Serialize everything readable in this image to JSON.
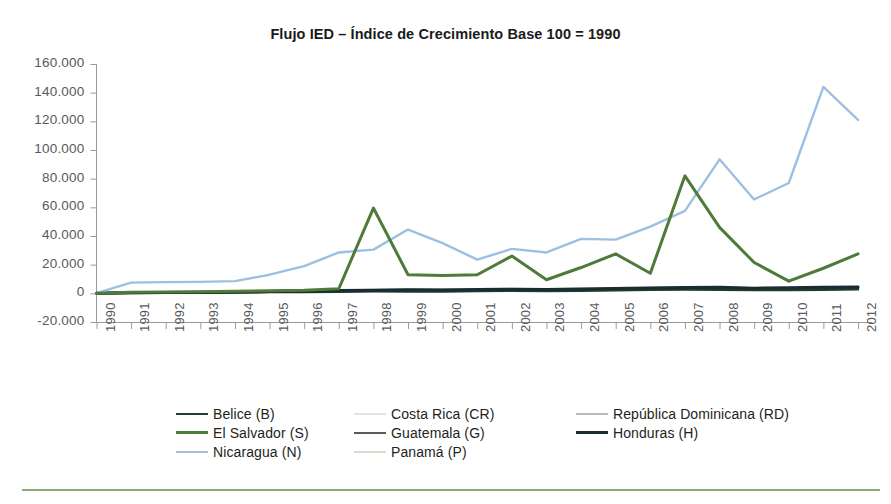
{
  "chart_data": {
    "type": "line",
    "title": "Flujo IED – Índice de Crecimiento Base 100 = 1990",
    "xlabel": "",
    "ylabel": "",
    "grid": false,
    "legend_position": "bottom",
    "ylim": [
      -20000,
      160000
    ],
    "ytick_step": 20000,
    "ytick_labels": [
      "160.000",
      "140.000",
      "120.000",
      "100.000",
      "80.000",
      "60.000",
      "40.000",
      "20.000",
      "0",
      "-20.000"
    ],
    "ytick_values": [
      160000,
      140000,
      120000,
      100000,
      80000,
      60000,
      40000,
      20000,
      0,
      -20000
    ],
    "categories": [
      "1990",
      "1991",
      "1992",
      "1993",
      "1994",
      "1995",
      "1996",
      "1997",
      "1998",
      "1999",
      "2000",
      "2001",
      "2002",
      "2003",
      "2004",
      "2005",
      "2006",
      "2007",
      "2008",
      "2009",
      "2010",
      "2011",
      "2012"
    ],
    "x": [
      1990,
      1991,
      1992,
      1993,
      1994,
      1995,
      1996,
      1997,
      1998,
      1999,
      2000,
      2001,
      2002,
      2003,
      2004,
      2005,
      2006,
      2007,
      2008,
      2009,
      2010,
      2011,
      2012
    ],
    "series": [
      {
        "name": "Belice (B)",
        "code": "B",
        "color": "#1f3d2b",
        "width": 2.6,
        "values": [
          100,
          400,
          600,
          500,
          700,
          900,
          1000,
          1200,
          1500,
          1400,
          1300,
          1600,
          1800,
          1700,
          1900,
          2200,
          2500,
          2700,
          2600,
          2300,
          2400,
          2600,
          2800
        ]
      },
      {
        "name": "Costa Rica (CR)",
        "code": "CR",
        "color": "#e3e3e1",
        "width": 2.2,
        "values": [
          100,
          300,
          500,
          600,
          700,
          800,
          900,
          1100,
          1300,
          1500,
          1400,
          1600,
          1800,
          1700,
          2000,
          2300,
          2600,
          3000,
          3200,
          2400,
          2600,
          3100,
          3300
        ]
      },
      {
        "name": "República Dominicana (RD)",
        "code": "RD",
        "color": "#b7bdb3",
        "width": 2.2,
        "values": [
          100,
          400,
          700,
          900,
          1100,
          1400,
          1600,
          2000,
          2400,
          2800,
          2700,
          3000,
          3200,
          2900,
          3100,
          3600,
          3800,
          4200,
          4400,
          3500,
          3700,
          4100,
          4300
        ]
      },
      {
        "name": "El Salvador (S)",
        "code": "S",
        "color": "#4e7a3a",
        "width": 3.0,
        "values": [
          100,
          700,
          900,
          1100,
          1400,
          1800,
          2200,
          3200,
          59500,
          13000,
          12500,
          13000,
          26000,
          9500,
          18000,
          27500,
          14000,
          82000,
          46000,
          21500,
          8500,
          17500,
          27500
        ]
      },
      {
        "name": "Guatemala (G)",
        "code": "G",
        "color": "#5a5a5a",
        "width": 2.6,
        "values": [
          100,
          300,
          500,
          700,
          900,
          1100,
          1300,
          1600,
          1800,
          2000,
          1900,
          2100,
          2300,
          2200,
          2500,
          2800,
          3100,
          3500,
          3700,
          3000,
          3200,
          3600,
          3800
        ]
      },
      {
        "name": "Honduras (H)",
        "code": "H",
        "color": "#1a2b33",
        "width": 3.0,
        "values": [
          100,
          400,
          600,
          800,
          1000,
          1300,
          1500,
          1900,
          2200,
          2500,
          2400,
          2600,
          2900,
          2700,
          3000,
          3400,
          3700,
          4100,
          4300,
          3600,
          3900,
          4300,
          4500
        ]
      },
      {
        "name": "Nicaragua (N)",
        "code": "N",
        "color": "#9dc0e0",
        "width": 2.4,
        "values": [
          100,
          7500,
          7800,
          8000,
          8500,
          13000,
          19000,
          28500,
          30500,
          44500,
          35000,
          23500,
          31000,
          28500,
          38000,
          37500,
          46500,
          57500,
          93500,
          65500,
          77000,
          144000,
          121000
        ]
      },
      {
        "name": "Panamá (P)",
        "code": "P",
        "color": "#ded9cd",
        "width": 2.2,
        "values": [
          100,
          300,
          400,
          600,
          800,
          1000,
          1200,
          1500,
          1700,
          1900,
          1800,
          2000,
          2200,
          2100,
          2400,
          2700,
          3000,
          3300,
          3500,
          2800,
          3100,
          3500,
          3700
        ]
      }
    ],
    "legend_columns": [
      [
        "Belice (B)",
        "El Salvador (S)",
        "Nicaragua (N)"
      ],
      [
        "Costa Rica (CR)",
        "Guatemala (G)",
        "Panamá (P)"
      ],
      [
        "República Dominicana (RD)",
        "Honduras (H)"
      ]
    ]
  },
  "footer": {
    "rule_color": "#8aab79"
  }
}
